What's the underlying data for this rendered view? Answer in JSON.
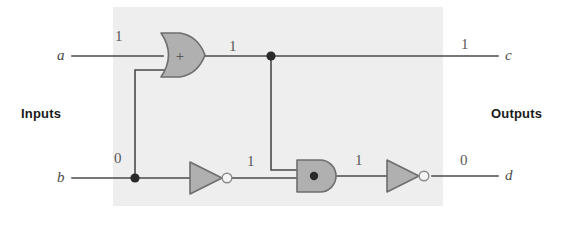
{
  "figure": {
    "type": "logic-circuit-diagram",
    "panel_color": "#eeeeee",
    "gate_fill": "#b0b0b0",
    "gate_stroke": "#6e6e6e",
    "wire_color": "#4a4a4a"
  },
  "sections": {
    "inputs_label": "Inputs",
    "outputs_label": "Outputs"
  },
  "inputs": [
    {
      "name": "a",
      "value": "1"
    },
    {
      "name": "b",
      "value": "0"
    }
  ],
  "outputs": [
    {
      "name": "c",
      "value": "1"
    },
    {
      "name": "d",
      "value": "0"
    }
  ],
  "gates": [
    {
      "id": "or1",
      "type": "OR",
      "symbol": "+",
      "output_value": "1"
    },
    {
      "id": "not1",
      "type": "NOT",
      "symbol": "",
      "output_value": "1"
    },
    {
      "id": "and1",
      "type": "AND",
      "symbol": "●",
      "output_value": "1"
    },
    {
      "id": "not2",
      "type": "NOT",
      "symbol": "",
      "output_value": "0"
    }
  ],
  "wire_values": {
    "a_in": "1",
    "b_in": "0",
    "or_out": "1",
    "not1_out": "1",
    "and_out": "1",
    "c_out": "1",
    "d_out": "0"
  }
}
